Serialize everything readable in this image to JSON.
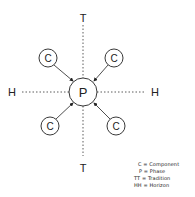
{
  "diagram": {
    "center": {
      "label": "P",
      "x": 83,
      "y": 92,
      "r": 14
    },
    "components": [
      {
        "label": "C",
        "x": 48,
        "y": 58
      },
      {
        "label": "C",
        "x": 114,
        "y": 58
      },
      {
        "label": "C",
        "x": 50,
        "y": 126
      },
      {
        "label": "C",
        "x": 116,
        "y": 126
      }
    ],
    "axes": {
      "vertical": {
        "label_top": "T",
        "label_bottom": "T"
      },
      "horizontal": {
        "label_left": "H",
        "label_right": "H"
      }
    }
  },
  "legend": {
    "items": [
      "C = Component",
      "P = Phase",
      "TT = Tradition",
      "HH = Horizon"
    ]
  },
  "colors": {
    "ink": "#222222",
    "background": "#ffffff"
  }
}
